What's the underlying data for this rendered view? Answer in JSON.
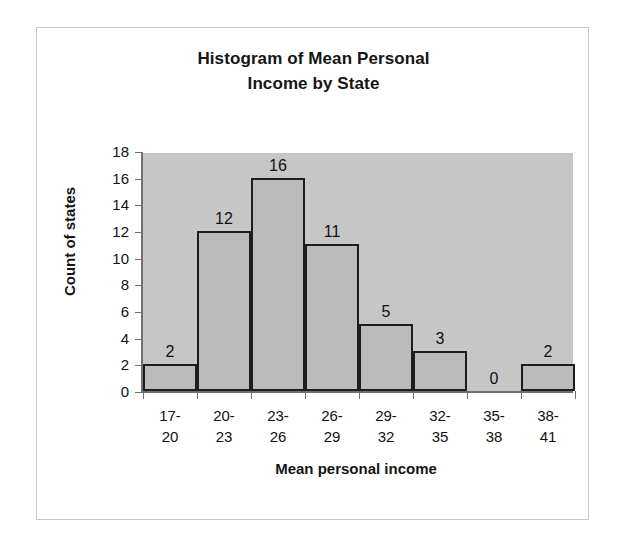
{
  "chart_data": {
    "type": "bar",
    "title": "Histogram of Mean Personal Income by State",
    "title_line1": "Histogram of Mean Personal",
    "title_line2": "Income by State",
    "xlabel": "Mean personal income",
    "ylabel": "Count of states",
    "categories": [
      "17-20",
      "20-23",
      "23-26",
      "26-29",
      "29-32",
      "32-35",
      "35-38",
      "38-41"
    ],
    "category_lines": [
      {
        "top": "17-",
        "bottom": "20"
      },
      {
        "top": "20-",
        "bottom": "23"
      },
      {
        "top": "23-",
        "bottom": "26"
      },
      {
        "top": "26-",
        "bottom": "29"
      },
      {
        "top": "29-",
        "bottom": "32"
      },
      {
        "top": "32-",
        "bottom": "35"
      },
      {
        "top": "35-",
        "bottom": "38"
      },
      {
        "top": "38-",
        "bottom": "41"
      }
    ],
    "values": [
      2,
      12,
      16,
      11,
      5,
      3,
      0,
      2
    ],
    "data_labels": [
      "2",
      "12",
      "16",
      "11",
      "5",
      "3",
      "0",
      "2"
    ],
    "ylim": [
      0,
      18
    ],
    "yticks": [
      0,
      2,
      4,
      6,
      8,
      10,
      12,
      14,
      16,
      18
    ],
    "ytick_labels": [
      "0",
      "2",
      "4",
      "6",
      "8",
      "10",
      "12",
      "14",
      "16",
      "18"
    ],
    "grid": false,
    "legend": "none",
    "bar_gap": 0,
    "colors": {
      "plot_background": "#c6c6c6",
      "bar_fill": "#bbbbbb",
      "bar_border": "#1d1d1d",
      "axis": "#6f6f6f",
      "text": "#111111",
      "frame_border": "#c9c9c9",
      "page_background": "#ffffff"
    }
  }
}
